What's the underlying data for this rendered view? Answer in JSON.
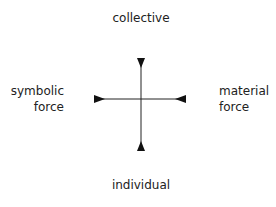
{
  "diagram": {
    "type": "axes-cross",
    "labels": {
      "top": "collective",
      "bottom": "individual",
      "left_line1": "symbolic",
      "left_line2": "force",
      "right_line1": "material",
      "right_line2": "force"
    },
    "arrow_direction": "inward",
    "line_color": "#222222"
  }
}
